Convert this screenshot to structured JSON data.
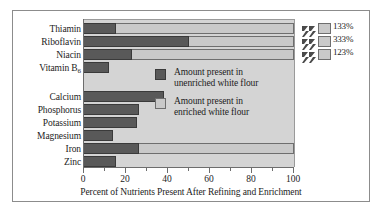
{
  "chart_data": {
    "type": "bar",
    "orientation": "horizontal",
    "title": "",
    "xlabel": "Percent of Nutrients Present After Refining and Enrichment",
    "ylabel": "",
    "xlim": [
      0,
      100
    ],
    "xticks": [
      0,
      20,
      40,
      60,
      80,
      100
    ],
    "xtick_labels": [
      "0",
      "20",
      "40",
      "60",
      "80",
      "100"
    ],
    "minor_ticks": [
      10,
      30,
      50,
      70,
      90
    ],
    "grid": false,
    "legend_position": "center-right-inside",
    "axis_break": true,
    "axis_break_note": "Bars exceeding 100% are truncated with a zigzag break mark; true value printed at bar end.",
    "categories": [
      "Thiamin",
      "Riboflavin",
      "Niacin",
      "Vitamin B6",
      "Calcium",
      "Phosphorus",
      "Potassium",
      "Magnesium",
      "Iron",
      "Zinc"
    ],
    "series": [
      {
        "name": "Amount present in unenriched white flour",
        "color": "#595959",
        "values": [
          15,
          50,
          23,
          12,
          38,
          26,
          25,
          14,
          26,
          15
        ]
      },
      {
        "name": "Amount present in enriched white flour",
        "color": "#c9c9c9",
        "values": [
          133,
          333,
          123,
          12,
          38,
          26,
          25,
          14,
          100,
          15
        ]
      }
    ],
    "data_labels": [
      {
        "category": "Thiamin",
        "text": "133%"
      },
      {
        "category": "Riboflavin",
        "text": "333%"
      },
      {
        "category": "Niacin",
        "text": "123%"
      }
    ]
  },
  "bars": [
    {
      "label": "Thiamin",
      "label_sub": "",
      "dark_pct": 15,
      "light_pct": 100,
      "broken": true,
      "value_text": "133%"
    },
    {
      "label": "Riboflavin",
      "label_sub": "",
      "dark_pct": 50,
      "light_pct": 100,
      "broken": true,
      "value_text": "333%"
    },
    {
      "label": "Niacin",
      "label_sub": "",
      "dark_pct": 23,
      "light_pct": 100,
      "broken": true,
      "value_text": "123%"
    },
    {
      "label": "Vitamin B",
      "label_sub": "6",
      "dark_pct": 12,
      "light_pct": 12,
      "broken": false,
      "value_text": ""
    },
    {
      "label": "Calcium",
      "label_sub": "",
      "dark_pct": 38,
      "light_pct": 38,
      "broken": false,
      "value_text": ""
    },
    {
      "label": "Phosphorus",
      "label_sub": "",
      "dark_pct": 26,
      "light_pct": 26,
      "broken": false,
      "value_text": ""
    },
    {
      "label": "Potassium",
      "label_sub": "",
      "dark_pct": 25,
      "light_pct": 25,
      "broken": false,
      "value_text": ""
    },
    {
      "label": "Magnesium",
      "label_sub": "",
      "dark_pct": 14,
      "light_pct": 14,
      "broken": false,
      "value_text": ""
    },
    {
      "label": "Iron",
      "label_sub": "",
      "dark_pct": 26,
      "light_pct": 100,
      "broken": false,
      "value_text": ""
    },
    {
      "label": "Zinc",
      "label_sub": "",
      "dark_pct": 15,
      "light_pct": 15,
      "broken": false,
      "value_text": ""
    }
  ],
  "legend": {
    "items": [
      {
        "swatch": "dark",
        "line1": "Amount present in",
        "line2": "unenriched white flour"
      },
      {
        "swatch": "light",
        "line1": "Amount present in",
        "line2": "enriched white flour"
      }
    ]
  },
  "axis": {
    "title": "Percent of Nutrients Present After Refining and Enrichment",
    "tick_labels": [
      "0",
      "20",
      "40",
      "60",
      "80",
      "100"
    ]
  },
  "colors": {
    "unenriched": "#595959",
    "enriched": "#c9c9c9",
    "plot_background": "#d4d4d4",
    "frame": "#8c8c8c",
    "text": "#1c1c1c"
  }
}
